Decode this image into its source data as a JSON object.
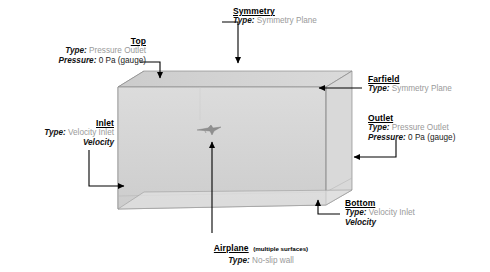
{
  "figure": {
    "kind": "cfd-domain-boundary-conditions",
    "background": "#ffffff",
    "box_fill_front": "#d9d9d9",
    "box_fill_top": "#cfcfcf",
    "box_fill_side": "#bdbdbd",
    "box_edge": "#8a8a8a",
    "arrow_color": "#000000",
    "label_value_grey": "#9a9a9a"
  },
  "labels": {
    "top": {
      "title": "Top",
      "type_key": "Type:",
      "type_value": "Pressure Outlet",
      "pressure_key": "Pressure:",
      "pressure_value": "0 Pa (gauge)"
    },
    "symmetry": {
      "title": "Symmetry",
      "type_key": "Type:",
      "type_value": "Symmetry Plane"
    },
    "farfield": {
      "title": "Farfield",
      "type_key": "Type:",
      "type_value": "Symmetry Plane"
    },
    "outlet": {
      "title": "Outlet",
      "type_key": "Type:",
      "type_value": "Pressure Outlet",
      "pressure_key": "Pressure:",
      "pressure_value": "0 Pa (gauge)"
    },
    "inlet": {
      "title": "Inlet",
      "type_key": "Type:",
      "type_value": "Velocity Inlet",
      "velocity": "Velocity"
    },
    "bottom": {
      "title": "Bottom",
      "type_key": "Type:",
      "type_value": "Velocity Inlet",
      "velocity": "Velocity"
    },
    "airplane": {
      "title": "Airplane",
      "note": "(multiple surfaces)",
      "type_key": "Type:",
      "type_value": "No-slip wall"
    }
  }
}
